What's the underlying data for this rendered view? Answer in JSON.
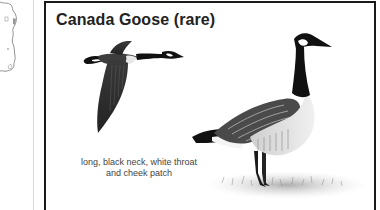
{
  "sidebar": {
    "map_icon": "map-outline-icon"
  },
  "card": {
    "title": "Canada Goose (rare)",
    "caption": "long, black neck, white throat and cheek patch",
    "illustrations": [
      {
        "name": "flying-goose-illustration",
        "pose": "flying"
      },
      {
        "name": "standing-goose-illustration",
        "pose": "standing"
      }
    ]
  },
  "colors": {
    "frame_border": "#1a1a1a",
    "divider": "#d8d8d8",
    "title": "#222222",
    "caption": "#444444",
    "background": "#ffffff"
  }
}
